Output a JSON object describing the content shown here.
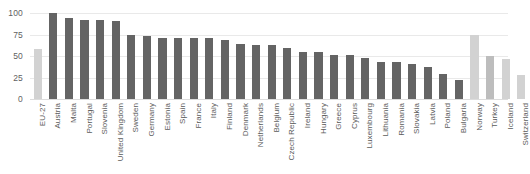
{
  "chart_data": {
    "type": "bar",
    "title": "",
    "xlabel": "",
    "ylabel": "",
    "ylim": [
      0,
      100
    ],
    "yticks": [
      0,
      25,
      50,
      75,
      100
    ],
    "grid": true,
    "legend": false,
    "orientation": "vertical",
    "categories": [
      "EU-27",
      "Austria",
      "Malta",
      "Portugal",
      "Slovenia",
      "United Kingdom",
      "Sweden",
      "Germany",
      "Estonia",
      "Spain",
      "France",
      "Italy",
      "Finland",
      "Denmark",
      "Netherlands",
      "Belgium",
      "Czech Republic",
      "Ireland",
      "Hungary",
      "Greece",
      "Cyprus",
      "Luxembourg",
      "Lithuania",
      "Romania",
      "Slovakia",
      "Latvia",
      "Poland",
      "Bulgaria",
      "Norway",
      "Turkey",
      "Iceland",
      "Switzerland"
    ],
    "values": [
      58,
      100,
      94,
      92,
      92,
      91,
      74,
      73,
      71,
      71,
      71,
      71,
      69,
      64,
      63,
      63,
      59,
      55,
      55,
      51,
      51,
      48,
      43,
      43,
      41,
      37,
      29,
      22,
      74,
      50,
      47,
      28
    ],
    "bar_styles": [
      "light",
      "dark",
      "dark",
      "dark",
      "dark",
      "dark",
      "dark",
      "dark",
      "dark",
      "dark",
      "dark",
      "dark",
      "dark",
      "dark",
      "dark",
      "dark",
      "dark",
      "dark",
      "dark",
      "dark",
      "dark",
      "dark",
      "dark",
      "dark",
      "dark",
      "dark",
      "dark",
      "dark",
      "light",
      "mid",
      "light",
      "light"
    ],
    "colors": {
      "bar_dark": "#646464",
      "bar_light": "#d2d2d2",
      "bar_mid": "#bdbdbd",
      "gridline": "#e9e9e9",
      "text": "#5b5b5b",
      "background": "#ffffff"
    }
  }
}
